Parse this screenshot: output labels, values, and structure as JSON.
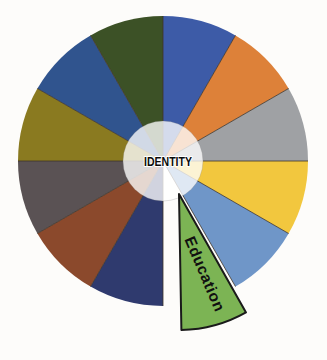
{
  "figure": {
    "background": "#FDFCFA",
    "center_label": "IDENTITY",
    "divider_color": "#3F3429",
    "hub_overlay_color": "#FFFFFF",
    "segments": [
      {
        "position": 1,
        "color": "#3D5BA7",
        "label": "",
        "exploded": false
      },
      {
        "position": 2,
        "color": "#DD8139",
        "label": "",
        "exploded": false
      },
      {
        "position": 3,
        "color": "#9FA1A4",
        "label": "",
        "exploded": false
      },
      {
        "position": 4,
        "color": "#F2C73E",
        "label": "",
        "exploded": false
      },
      {
        "position": 5,
        "color": "#6F96C8",
        "label": "",
        "exploded": false
      },
      {
        "position": 6,
        "color": "#7CB454",
        "label": "Education",
        "exploded": true,
        "outline": "#1A1A1A"
      },
      {
        "position": 7,
        "color": "#2F3A6E",
        "label": "",
        "exploded": false
      },
      {
        "position": 8,
        "color": "#8B492C",
        "label": "",
        "exploded": false
      },
      {
        "position": 9,
        "color": "#5A5254",
        "label": "",
        "exploded": false
      },
      {
        "position": 10,
        "color": "#8A7A20",
        "label": "",
        "exploded": false
      },
      {
        "position": 11,
        "color": "#30548E",
        "label": "",
        "exploded": false
      },
      {
        "position": 12,
        "color": "#3C5126",
        "label": "",
        "exploded": false
      }
    ]
  }
}
